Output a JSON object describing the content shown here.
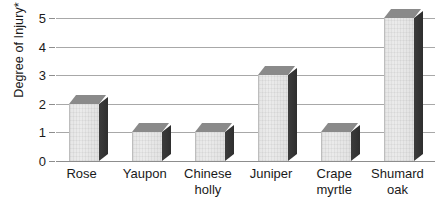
{
  "chart_data": {
    "type": "bar",
    "title": "",
    "subtitle": "",
    "xlabel": "",
    "ylabel": "Degree of Injury*",
    "categories": [
      "Rose",
      "Yaupon",
      "Chinese holly",
      "Juniper",
      "Crape myrtle",
      "Shumard oak"
    ],
    "category_lines": [
      [
        "Rose"
      ],
      [
        "Yaupon"
      ],
      [
        "Chinese",
        "holly"
      ],
      [
        "Juniper"
      ],
      [
        "Crape",
        "myrtle"
      ],
      [
        "Shumard",
        "oak"
      ]
    ],
    "values": [
      2,
      1,
      1,
      3,
      1,
      5
    ],
    "ylim": [
      0,
      5
    ],
    "ytick_labels": [
      "5",
      "4",
      "3",
      "2",
      "1",
      "0"
    ],
    "ytick_values": [
      5,
      4,
      3,
      2,
      1,
      0
    ],
    "grid": true,
    "legend": "none",
    "style": "3d-grayscale",
    "colors": {
      "bar_front": "#e8e8e8",
      "bar_top": "#8a8a8a",
      "bar_side": "#343434",
      "gridline": "#a8a8a8",
      "text": "#1a1a1a",
      "background": "#ffffff"
    },
    "footnote_marker": "*"
  }
}
